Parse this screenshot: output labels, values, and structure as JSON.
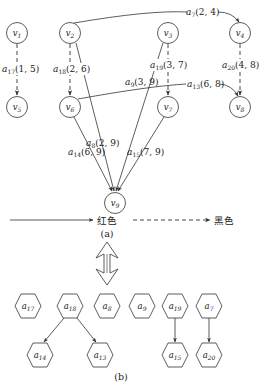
{
  "figure": {
    "part_a_caption": "(a)",
    "part_b_caption": "(b)",
    "legend": {
      "solid_label": "红色",
      "dashed_label": "黑色"
    },
    "colors": {
      "stroke": "#333333",
      "text": "#222222",
      "background": "#ffffff"
    }
  },
  "graph_a": {
    "nodes": [
      {
        "id": "v1",
        "base": "v",
        "sub": "1",
        "x": 17,
        "y": 33
      },
      {
        "id": "v2",
        "base": "v",
        "sub": "2",
        "x": 70,
        "y": 33
      },
      {
        "id": "v3",
        "base": "v",
        "sub": "3",
        "x": 168,
        "y": 33
      },
      {
        "id": "v4",
        "base": "v",
        "sub": "4",
        "x": 240,
        "y": 33
      },
      {
        "id": "v5",
        "base": "v",
        "sub": "5",
        "x": 17,
        "y": 107
      },
      {
        "id": "v6",
        "base": "v",
        "sub": "6",
        "x": 70,
        "y": 107
      },
      {
        "id": "v7",
        "base": "v",
        "sub": "7",
        "x": 168,
        "y": 107
      },
      {
        "id": "v8",
        "base": "v",
        "sub": "8",
        "x": 240,
        "y": 107
      },
      {
        "id": "v9",
        "base": "v",
        "sub": "9",
        "x": 115,
        "y": 203
      }
    ],
    "edges": [
      {
        "id": "a17",
        "base": "a",
        "sub": "17",
        "args": "(1, 5)",
        "from": "v1",
        "to": "v5",
        "style": "dashed"
      },
      {
        "id": "a18",
        "base": "a",
        "sub": "18",
        "args": "(2, 6)",
        "from": "v2",
        "to": "v6",
        "style": "dashed"
      },
      {
        "id": "a19",
        "base": "a",
        "sub": "19",
        "args": "(3, 7)",
        "from": "v3",
        "to": "v7",
        "style": "dashed"
      },
      {
        "id": "a20",
        "base": "a",
        "sub": "20",
        "args": "(4, 8)",
        "from": "v4",
        "to": "v8",
        "style": "dashed"
      },
      {
        "id": "a7",
        "base": "a",
        "sub": "7",
        "args": "(2, 4)",
        "from": "v2",
        "to": "v4",
        "style": "solid"
      },
      {
        "id": "a13",
        "base": "a",
        "sub": "13",
        "args": "(6, 8)",
        "from": "v6",
        "to": "v8",
        "style": "solid"
      },
      {
        "id": "a8",
        "base": "a",
        "sub": "8",
        "args": "(2, 9)",
        "from": "v2",
        "to": "v9",
        "style": "solid"
      },
      {
        "id": "a9",
        "base": "a",
        "sub": "9",
        "args": "(3, 9)",
        "from": "v3",
        "to": "v9",
        "style": "solid"
      },
      {
        "id": "a14",
        "base": "a",
        "sub": "14",
        "args": "(6, 9)",
        "from": "v6",
        "to": "v9",
        "style": "solid"
      },
      {
        "id": "a15",
        "base": "a",
        "sub": "15",
        "args": "(7, 9)",
        "from": "v7",
        "to": "v9",
        "style": "solid"
      }
    ]
  },
  "graph_b": {
    "nodes": [
      {
        "id": "a17",
        "base": "a",
        "sub": "17",
        "x": 28,
        "y": 306
      },
      {
        "id": "a18",
        "base": "a",
        "sub": "18",
        "x": 70,
        "y": 306
      },
      {
        "id": "a8",
        "base": "a",
        "sub": "8",
        "x": 107,
        "y": 306
      },
      {
        "id": "a9",
        "base": "a",
        "sub": "9",
        "x": 142,
        "y": 306
      },
      {
        "id": "a19",
        "base": "a",
        "sub": "19",
        "x": 175,
        "y": 306
      },
      {
        "id": "a7",
        "base": "a",
        "sub": "7",
        "x": 209,
        "y": 306
      },
      {
        "id": "a14",
        "base": "a",
        "sub": "14",
        "x": 40,
        "y": 355
      },
      {
        "id": "a13",
        "base": "a",
        "sub": "13",
        "x": 100,
        "y": 355
      },
      {
        "id": "a15",
        "base": "a",
        "sub": "15",
        "x": 175,
        "y": 355
      },
      {
        "id": "a20",
        "base": "a",
        "sub": "20",
        "x": 209,
        "y": 355
      }
    ],
    "edges": [
      {
        "from": "a18",
        "to": "a14"
      },
      {
        "from": "a18",
        "to": "a13"
      },
      {
        "from": "a19",
        "to": "a15"
      },
      {
        "from": "a7",
        "to": "a20"
      }
    ]
  }
}
